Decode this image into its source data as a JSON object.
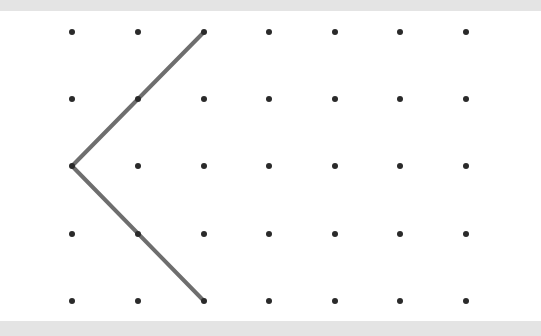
{
  "diagram": {
    "type": "dot-grid-drawing",
    "background": "#ffffff",
    "band_color": "#e4e4e4",
    "dot_color": "#2a2a2a",
    "line_color": "#6e6e6e",
    "grid": {
      "columns_x": [
        72,
        138,
        204,
        269,
        335,
        400,
        466
      ],
      "rows_y": [
        32,
        99,
        166,
        234,
        301
      ],
      "dot_radius": 3
    },
    "polyline": {
      "points_grid": [
        [
          2,
          0
        ],
        [
          0,
          2
        ],
        [
          2,
          4
        ]
      ],
      "stroke_width": 4
    }
  }
}
